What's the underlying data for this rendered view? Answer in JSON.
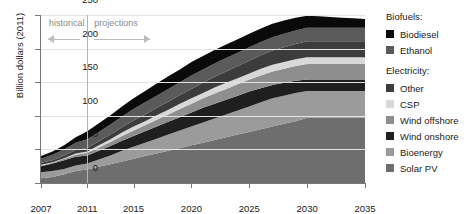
{
  "chart_data": {
    "type": "area",
    "title": "",
    "xlabel": "",
    "ylabel": "Billion dollars (2011)",
    "xlim": [
      2007,
      2035
    ],
    "ylim": [
      0,
      250
    ],
    "yticks": [
      0,
      50,
      100,
      150,
      200,
      250
    ],
    "xticks": [
      2007,
      2011,
      2015,
      2020,
      2025,
      2030,
      2035
    ],
    "grid": true,
    "stacked": true,
    "legend_position": "right",
    "x": [
      2007,
      2008,
      2009,
      2010,
      2011,
      2012,
      2013,
      2014,
      2015,
      2016,
      2017,
      2018,
      2019,
      2020,
      2021,
      2022,
      2023,
      2024,
      2025,
      2026,
      2027,
      2028,
      2029,
      2030,
      2031,
      2032,
      2033,
      2034,
      2035
    ],
    "series": [
      {
        "name": "Solar PV",
        "color": "#6e6e6e",
        "values": [
          7,
          9,
          13,
          18,
          20,
          24,
          28,
          32,
          36,
          40,
          44,
          48,
          52,
          56,
          60,
          64,
          68,
          72,
          76,
          80,
          84,
          88,
          92,
          97,
          97,
          97,
          97,
          97,
          97
        ]
      },
      {
        "name": "Bioenergy",
        "color": "#9b9b9b",
        "values": [
          9,
          9,
          8,
          8,
          9,
          11,
          13,
          16,
          18,
          20,
          22,
          24,
          26,
          28,
          30,
          32,
          34,
          36,
          38,
          40,
          42,
          42,
          42,
          40,
          40,
          40,
          40,
          40,
          40
        ]
      },
      {
        "name": "Wind onshore",
        "color": "#1f1f1f",
        "values": [
          9,
          11,
          13,
          13,
          12,
          13,
          14,
          15,
          16,
          17,
          18,
          19,
          20,
          21,
          22,
          22,
          22,
          22,
          22,
          21,
          20,
          19,
          18,
          17,
          17,
          17,
          17,
          17,
          17
        ]
      },
      {
        "name": "Wind offshore",
        "color": "#8e8e8e",
        "values": [
          1,
          1,
          2,
          3,
          4,
          5,
          6,
          7,
          8,
          9,
          10,
          11,
          12,
          13,
          14,
          15,
          16,
          17,
          18,
          19,
          20,
          21,
          22,
          23,
          23,
          23,
          23,
          23,
          23
        ]
      },
      {
        "name": "CSP",
        "color": "#d8d8d8",
        "values": [
          1,
          1,
          1,
          2,
          2,
          3,
          4,
          5,
          6,
          6,
          7,
          7,
          8,
          8,
          8,
          9,
          9,
          9,
          9,
          10,
          10,
          10,
          10,
          10,
          10,
          10,
          10,
          10,
          10
        ]
      },
      {
        "name": "Other",
        "color": "#3c3c3c",
        "values": [
          3,
          3,
          4,
          5,
          5,
          6,
          7,
          8,
          9,
          10,
          11,
          12,
          13,
          14,
          15,
          16,
          17,
          18,
          19,
          20,
          21,
          22,
          23,
          24,
          24,
          24,
          24,
          24,
          24
        ]
      },
      {
        "name": "Ethanol",
        "color": "#5a5a5a",
        "values": [
          6,
          8,
          9,
          11,
          13,
          14,
          15,
          16,
          17,
          18,
          18,
          19,
          19,
          20,
          20,
          20,
          20,
          20,
          20,
          20,
          20,
          20,
          20,
          20,
          20,
          20,
          20,
          20,
          20
        ]
      },
      {
        "name": "Biodiesel",
        "color": "#0a0a0a",
        "values": [
          4,
          5,
          6,
          8,
          12,
          13,
          14,
          15,
          16,
          17,
          18,
          19,
          19,
          20,
          20,
          20,
          20,
          20,
          20,
          20,
          20,
          20,
          19,
          18,
          17,
          16,
          15,
          14,
          13
        ]
      }
    ],
    "annotations": [
      {
        "name": "historical",
        "text": "historical",
        "from": 2007,
        "to": 2011
      },
      {
        "name": "projections",
        "text": "projections",
        "from": 2011,
        "to": 2016
      },
      {
        "name": "divider",
        "x": 2011
      }
    ]
  },
  "legend": {
    "group_biofuels_label": "Biofuels:",
    "group_electricity_label": "Electricity:",
    "biofuels": [
      "Biodiesel",
      "Ethanol"
    ],
    "electricity": [
      "Other",
      "CSP",
      "Wind offshore",
      "Wind onshore",
      "Bioenergy",
      "Solar PV"
    ]
  },
  "axes": {
    "ylabel": "Billion dollars (2011)",
    "yticks": [
      "0",
      "50",
      "100",
      "150",
      "200",
      "250"
    ],
    "xticks": [
      "2007",
      "2011",
      "2015",
      "2020",
      "2025",
      "2030",
      "2035"
    ]
  },
  "colors": {
    "biodiesel": "#0a0a0a",
    "ethanol": "#5a5a5a",
    "other": "#3c3c3c",
    "csp": "#d8d8d8",
    "wind_offshore": "#8e8e8e",
    "wind_onshore": "#1f1f1f",
    "bioenergy": "#9b9b9b",
    "solar_pv": "#6e6e6e",
    "grid": "#e3e3e3",
    "axis": "#777777",
    "annotation": "#8a8a8a"
  }
}
